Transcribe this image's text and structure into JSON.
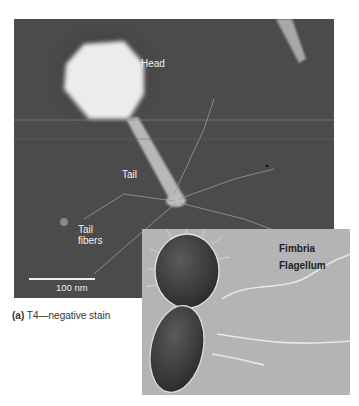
{
  "figure": {
    "panel_a": {
      "labels": {
        "head": "Head",
        "tail": "Tail",
        "tail_fibers_line1": "Tail",
        "tail_fibers_line2": "fibers"
      },
      "scale_bar": "100 nm",
      "caption_letter": "(a)",
      "caption_text": "T4—negative stain"
    },
    "inset": {
      "labels": {
        "fimbria": "Fimbria",
        "flagellum": "Flagellum"
      }
    }
  }
}
